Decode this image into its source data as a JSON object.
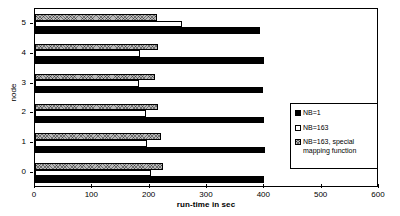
{
  "chart_data": {
    "type": "bar",
    "orientation": "horizontal",
    "title": "",
    "xlabel": "run-time in sec",
    "ylabel": "node",
    "categories": [
      "0",
      "1",
      "2",
      "3",
      "4",
      "5"
    ],
    "xlim": [
      0,
      600
    ],
    "xticks": [
      0,
      100,
      200,
      300,
      400,
      500,
      600
    ],
    "grid": false,
    "legend_position": "center-right",
    "series": [
      {
        "name": "NB=1",
        "swatch": "solid-black",
        "color": "#000000",
        "values": [
          400,
          402,
          399,
          398,
          400,
          393
        ]
      },
      {
        "name": "NB=163",
        "swatch": "white-outline",
        "color": "#ffffff",
        "values": [
          202,
          195,
          193,
          181,
          183,
          257
        ]
      },
      {
        "name": "NB=163, special\nmapping function",
        "swatch": "crosshatch-gray",
        "color": "#b9b9b9",
        "values": [
          223,
          219,
          214,
          209,
          214,
          212
        ]
      }
    ]
  },
  "axes": {
    "y_tick_labels": [
      "0",
      "1",
      "2",
      "3",
      "4",
      "5"
    ],
    "x_tick_labels": [
      "0",
      "100",
      "200",
      "300",
      "400",
      "500",
      "600"
    ]
  },
  "legend": {
    "items": [
      {
        "label": "NB=1"
      },
      {
        "label": "NB=163"
      },
      {
        "label": "NB=163, special\nmapping function"
      }
    ]
  }
}
